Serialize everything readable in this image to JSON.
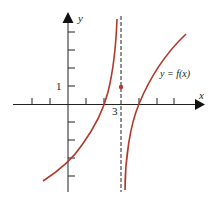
{
  "figure": {
    "axis_x_label": "x",
    "axis_y_label": "y",
    "tick_label_y": "1",
    "tick_label_x": "3",
    "curve_label": "y = f(x)",
    "colors": {
      "curve": "#b0392b",
      "axes": "#222222",
      "point": "#b0392b"
    },
    "asymptote": "x = 3",
    "point": {
      "x": 3,
      "y": 1
    }
  }
}
